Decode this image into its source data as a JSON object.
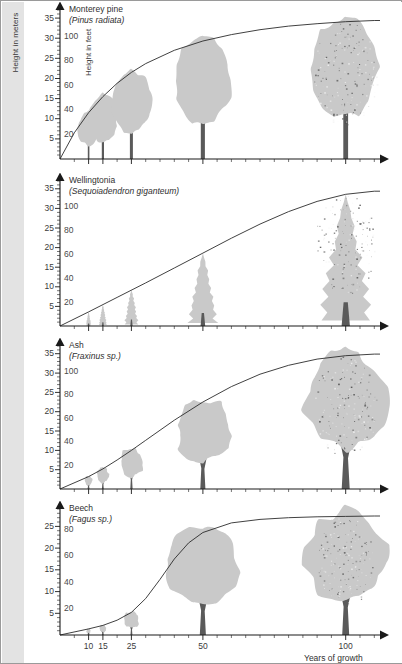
{
  "figure": {
    "meters_axis_label": "Height in meters",
    "feet_axis_label": "Height in feet",
    "x_axis_label": "Years of growth",
    "x_tick_labels": [
      "10",
      "15",
      "25",
      "50",
      "100"
    ],
    "meters_ticks": [
      "35",
      "30",
      "25",
      "20",
      "15",
      "10",
      "5"
    ],
    "feet_ticks": [
      "100",
      "80",
      "60",
      "40",
      "20"
    ],
    "feet_ticks_beech": [
      "100",
      "80",
      "60",
      "40",
      "20"
    ],
    "silhouette_color": "#c9c9c9",
    "trunk_color": "#5a5a5a",
    "curve_color": "#2b2b2b",
    "axis_color": "#1a1a1a",
    "strip_color": "#e3e3e3"
  },
  "panels": [
    {
      "id": "monterey-pine",
      "common_name": "Monterey pine",
      "scientific_name": "(Pinus radiata)",
      "crown_shape": "rounded-pine",
      "chart_index": 0
    },
    {
      "id": "wellingtonia",
      "common_name": "Wellingtonia",
      "scientific_name": "(Sequoiadendron giganteum)",
      "crown_shape": "conical",
      "chart_index": 1
    },
    {
      "id": "ash",
      "common_name": "Ash",
      "scientific_name": "(Fraxinus sp.)",
      "crown_shape": "broad-rounded",
      "chart_index": 2
    },
    {
      "id": "beech",
      "common_name": "Beech",
      "scientific_name": "(Fagus sp.)",
      "crown_shape": "broad-spreading",
      "chart_index": 3
    }
  ],
  "chart_data": {
    "type": "line",
    "xlabel": "Years of growth",
    "ylabel": "Height in meters / Height in feet",
    "xlim": [
      0,
      112
    ],
    "ylim_meters": [
      0,
      37
    ],
    "ylim_feet": [
      0,
      120
    ],
    "grid": false,
    "legend": "none",
    "x_ticks_major": [
      10,
      15,
      25,
      50,
      100
    ],
    "x_ticks_minor_step": 5,
    "y_ticks_meters": [
      5,
      10,
      15,
      20,
      25,
      30,
      35
    ],
    "y_ticks_feet": [
      20,
      40,
      60,
      80,
      100
    ],
    "series": [
      {
        "name": "Monterey pine (Pinus radiata)",
        "curve_shape": "concave-logarithmic",
        "x": [
          0,
          5,
          10,
          15,
          20,
          25,
          30,
          40,
          50,
          60,
          70,
          80,
          90,
          100,
          110
        ],
        "meters": [
          0,
          6.5,
          11.5,
          15.5,
          18.8,
          21.5,
          23.7,
          27.0,
          29.3,
          30.9,
          32.1,
          33.0,
          33.6,
          34.1,
          34.4
        ],
        "tree_markers_years": [
          10,
          15,
          25,
          50,
          100
        ],
        "tree_heights_meters": [
          11.5,
          15.5,
          21.5,
          29.3,
          34.1
        ]
      },
      {
        "name": "Wellingtonia (Sequoiadendron giganteum)",
        "curve_shape": "near-linear-then-plateau",
        "x": [
          0,
          10,
          20,
          30,
          40,
          50,
          60,
          70,
          80,
          90,
          100,
          110
        ],
        "meters": [
          0,
          3.6,
          7.3,
          11.0,
          14.8,
          18.6,
          22.4,
          26.0,
          29.2,
          31.8,
          33.6,
          34.4
        ],
        "tree_markers_years": [
          10,
          15,
          25,
          50,
          100
        ],
        "tree_heights_meters": [
          3.6,
          5.4,
          9.2,
          18.6,
          33.6
        ]
      },
      {
        "name": "Ash (Fraxinus sp.)",
        "curve_shape": "gentle-sigmoid",
        "x": [
          0,
          10,
          15,
          20,
          25,
          30,
          40,
          50,
          60,
          70,
          80,
          90,
          100,
          110
        ],
        "meters": [
          0,
          3.2,
          5.2,
          7.5,
          10.0,
          12.6,
          17.8,
          22.5,
          26.5,
          29.7,
          32.0,
          33.6,
          34.5,
          34.9
        ],
        "tree_markers_years": [
          10,
          15,
          25,
          50,
          100
        ],
        "tree_heights_meters": [
          3.2,
          5.2,
          10.0,
          22.5,
          34.5
        ]
      },
      {
        "name": "Beech (Fagus sp.)",
        "curve_shape": "steep-sigmoid",
        "x": [
          0,
          10,
          15,
          20,
          25,
          30,
          35,
          40,
          45,
          50,
          60,
          70,
          80,
          90,
          100,
          110
        ],
        "meters": [
          0,
          1.4,
          2.2,
          3.4,
          5.2,
          8.4,
          12.8,
          17.5,
          21.2,
          23.6,
          25.8,
          26.6,
          27.0,
          27.2,
          27.3,
          27.4
        ],
        "tree_markers_years": [
          10,
          15,
          25,
          50,
          100
        ],
        "tree_heights_meters": [
          1.4,
          2.2,
          5.2,
          23.6,
          27.3
        ]
      }
    ]
  }
}
